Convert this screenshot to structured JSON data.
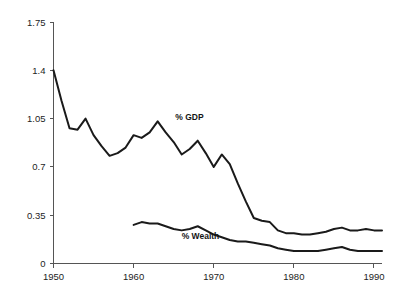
{
  "chart_data": {
    "type": "line",
    "title": "",
    "subtitle": "",
    "xlabel": "",
    "ylabel": "",
    "xlim": [
      1950,
      1991
    ],
    "ylim": [
      0,
      1.75
    ],
    "grid": false,
    "legend_position": "inline-annotation",
    "y_ticks": [
      "1.75",
      "1.4",
      "1.05",
      "0.7",
      "0.35",
      "0"
    ],
    "y_tick_values": [
      1.75,
      1.4,
      1.05,
      0.7,
      0.35,
      0
    ],
    "x_ticks": [
      "1950",
      "1960",
      "1970",
      "1980",
      "1990"
    ],
    "x_tick_values": [
      1950,
      1960,
      1970,
      1980,
      1990
    ],
    "annotations": [
      {
        "text": "% GDP",
        "x": 1965.2,
        "y": 1.04
      },
      {
        "text": "% Wealth",
        "x": 1966.0,
        "y": 0.175
      }
    ],
    "series": [
      {
        "name": "% GDP",
        "color": "#1a1a1a",
        "x": [
          1950,
          1951,
          1952,
          1953,
          1954,
          1955,
          1956,
          1957,
          1958,
          1959,
          1960,
          1961,
          1962,
          1963,
          1964,
          1965,
          1966,
          1967,
          1968,
          1969,
          1970,
          1971,
          1972,
          1973,
          1974,
          1975,
          1976,
          1977,
          1978,
          1979,
          1980,
          1981,
          1982,
          1983,
          1984,
          1985,
          1986,
          1987,
          1988,
          1989,
          1990,
          1991
        ],
        "values": [
          1.4,
          1.18,
          0.98,
          0.97,
          1.05,
          0.93,
          0.85,
          0.78,
          0.8,
          0.84,
          0.93,
          0.91,
          0.95,
          1.03,
          0.95,
          0.88,
          0.79,
          0.83,
          0.89,
          0.8,
          0.7,
          0.79,
          0.72,
          0.58,
          0.45,
          0.33,
          0.31,
          0.3,
          0.24,
          0.22,
          0.22,
          0.21,
          0.21,
          0.22,
          0.23,
          0.25,
          0.26,
          0.24,
          0.24,
          0.25,
          0.24,
          0.24
        ]
      },
      {
        "name": "% Wealth",
        "color": "#1a1a1a",
        "x": [
          1960,
          1961,
          1962,
          1963,
          1964,
          1965,
          1966,
          1967,
          1968,
          1969,
          1970,
          1971,
          1972,
          1973,
          1974,
          1975,
          1976,
          1977,
          1978,
          1979,
          1980,
          1981,
          1982,
          1983,
          1984,
          1985,
          1986,
          1987,
          1988,
          1989,
          1990,
          1991
        ],
        "values": [
          0.28,
          0.3,
          0.29,
          0.29,
          0.27,
          0.25,
          0.24,
          0.25,
          0.27,
          0.24,
          0.21,
          0.19,
          0.17,
          0.16,
          0.16,
          0.15,
          0.14,
          0.13,
          0.11,
          0.1,
          0.09,
          0.09,
          0.09,
          0.09,
          0.1,
          0.11,
          0.12,
          0.1,
          0.09,
          0.09,
          0.09,
          0.09
        ]
      }
    ]
  },
  "colors": {
    "background": "#ffffff",
    "axis": "#555555",
    "line": "#1a1a1a",
    "text": "#1d1d1d"
  }
}
